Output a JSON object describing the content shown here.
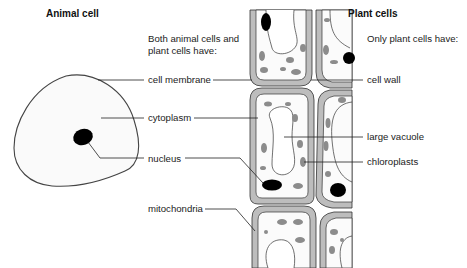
{
  "animal": {
    "title": "Animal cell"
  },
  "plant": {
    "title": "Plant cells",
    "subtitle": "Only plant cells have:",
    "labels": {
      "cell_wall": "cell wall",
      "large_vacuole": "large vacuole",
      "chloroplasts": "chloroplasts"
    }
  },
  "shared": {
    "heading_line1": "Both animal cells and",
    "heading_line2": "plant cells have:",
    "labels": {
      "cell_membrane": "cell membrane",
      "cytoplasm": "cytoplasm",
      "nucleus": "nucleus",
      "mitochondria": "mitochondria"
    }
  },
  "colors": {
    "outline": "#333333",
    "cell_wall_fill": "#b8b8b8",
    "cytoplasm_fill": "#f7f7f7",
    "organelle_fill": "#8a8a8a",
    "nucleus_fill": "#000000"
  }
}
